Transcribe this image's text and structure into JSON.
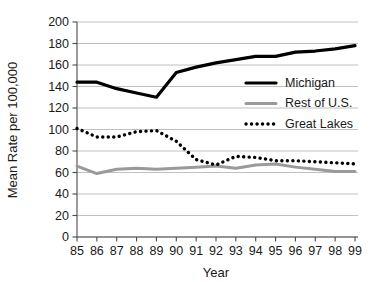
{
  "chart_data": {
    "type": "line",
    "title": "",
    "xlabel": "Year",
    "ylabel": "Mean Rate per 100,000",
    "categories": [
      "85",
      "86",
      "87",
      "88",
      "89",
      "90",
      "91",
      "92",
      "93",
      "94",
      "95",
      "96",
      "97",
      "98",
      "99"
    ],
    "x": [
      1985,
      1986,
      1987,
      1988,
      1989,
      1990,
      1991,
      1992,
      1993,
      1994,
      1995,
      1996,
      1997,
      1998,
      1999
    ],
    "xlim": [
      1985,
      1999
    ],
    "ylim": [
      0,
      200
    ],
    "yticks": [
      0,
      20,
      40,
      60,
      80,
      100,
      120,
      140,
      160,
      180,
      200
    ],
    "xticks": [
      "85",
      "86",
      "87",
      "88",
      "89",
      "90",
      "91",
      "92",
      "93",
      "94",
      "95",
      "96",
      "97",
      "98",
      "99"
    ],
    "grid": true,
    "legend_position": "right-middle",
    "series": [
      {
        "name": "Michigan",
        "style": "solid",
        "color": "#000000",
        "width": 3.2,
        "values": [
          144,
          144,
          138,
          134,
          130,
          153,
          158,
          162,
          165,
          168,
          168,
          172,
          173,
          175,
          178
        ]
      },
      {
        "name": "Rest of U.S.",
        "style": "solid",
        "color": "#9a9a9a",
        "width": 3.0,
        "values": [
          66,
          59,
          63,
          64,
          63,
          64,
          65,
          66,
          64,
          67,
          68,
          65,
          63,
          61,
          61
        ]
      },
      {
        "name": "Great Lakes",
        "style": "dotted",
        "color": "#000000",
        "width": 3.4,
        "values": [
          101,
          93,
          93,
          98,
          99,
          89,
          72,
          67,
          75,
          74,
          71,
          71,
          70,
          69,
          68
        ]
      }
    ]
  },
  "legend": {
    "entries": [
      {
        "label": "Michigan"
      },
      {
        "label": "Rest of U.S."
      },
      {
        "label": "Great Lakes"
      }
    ]
  },
  "axes": {
    "y_title": "Mean Rate per 100,000",
    "x_title": "Year"
  }
}
